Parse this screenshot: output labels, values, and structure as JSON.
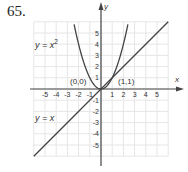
{
  "problem_number": "65.",
  "chart_data": {
    "type": "line",
    "title": "",
    "xlabel": "x",
    "ylabel": "y",
    "xlim": [
      -6,
      6
    ],
    "ylim": [
      -6,
      6
    ],
    "grid": true,
    "x_ticks": [
      -5,
      -4,
      -3,
      -2,
      -1,
      1,
      2,
      3,
      4,
      5
    ],
    "y_ticks": [
      5,
      4,
      3,
      2,
      1,
      -1,
      -2,
      -3,
      -4,
      -5
    ],
    "series": [
      {
        "name": "y = x^2",
        "label": "y = x",
        "label_sup": "2",
        "type": "parabola",
        "x": [
          -2.2,
          -2,
          -1,
          0,
          1,
          2,
          2.2
        ],
        "y": [
          4.84,
          4,
          1,
          0,
          1,
          4,
          4.84
        ]
      },
      {
        "name": "y = x",
        "label": "y = x",
        "type": "line",
        "x": [
          -6,
          6
        ],
        "y": [
          -6,
          6
        ]
      }
    ],
    "annotations": [
      {
        "text": "(0,0)",
        "x": 0,
        "y": 0
      },
      {
        "text": "(1,1)",
        "x": 1,
        "y": 1
      }
    ]
  },
  "labels": {
    "x_axis": "x",
    "y_axis": "y",
    "parabola_eq": "y = x",
    "parabola_exp": "2",
    "line_eq": "y = x",
    "point_origin": "(0,0)",
    "point_one": "(1,1)",
    "xticks": [
      "-5",
      "-4",
      "-3",
      "-2",
      "-1",
      "1",
      "2",
      "3",
      "4",
      "5"
    ],
    "yticks": [
      "5",
      "4",
      "3",
      "2",
      "1",
      "-1",
      "-2",
      "-3",
      "-4",
      "-5"
    ]
  }
}
